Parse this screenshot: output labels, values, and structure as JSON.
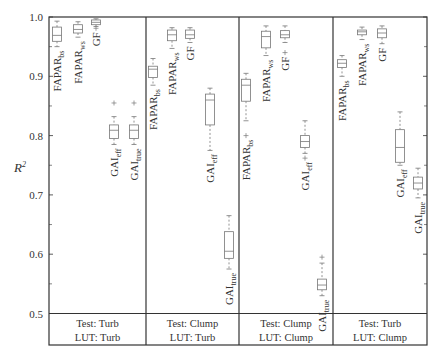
{
  "chart_data": {
    "type": "box",
    "title": "",
    "xlabel": "",
    "ylabel": "R²",
    "ylim": [
      0.5,
      1.0
    ],
    "yticks": [
      0.5,
      0.6,
      0.7,
      0.8,
      0.9,
      1.0
    ],
    "ytick_labels": [
      "0.5",
      "0.6",
      "0.7",
      "0.8",
      "0.9",
      "1.0"
    ],
    "grid": false,
    "panels": [
      {
        "test": "Test: Turb",
        "lut": "LUT: Turb",
        "boxes": [
          {
            "name": "FAPAR",
            "sub": "bs",
            "whisker_high": 0.993,
            "q3": 0.983,
            "median": 0.969,
            "q1": 0.959,
            "whisker_low": 0.95,
            "outliers": []
          },
          {
            "name": "FAPAR",
            "sub": "ws",
            "whisker_high": 0.992,
            "q3": 0.987,
            "median": 0.979,
            "q1": 0.973,
            "whisker_low": 0.966,
            "outliers": []
          },
          {
            "name": "GF",
            "sub": "",
            "whisker_high": 0.997,
            "q3": 0.995,
            "median": 0.991,
            "q1": 0.987,
            "whisker_low": 0.984,
            "outliers": [
              0.981
            ]
          },
          {
            "name": "GAI",
            "sub": "eff",
            "whisker_high": 0.832,
            "q3": 0.818,
            "median": 0.809,
            "q1": 0.795,
            "whisker_low": 0.785,
            "outliers": [
              0.855
            ]
          },
          {
            "name": "GAI",
            "sub": "true",
            "whisker_high": 0.832,
            "q3": 0.818,
            "median": 0.809,
            "q1": 0.795,
            "whisker_low": 0.785,
            "outliers": [
              0.855
            ]
          }
        ]
      },
      {
        "test": "Test: Clump",
        "lut": "LUT: Turb",
        "boxes": [
          {
            "name": "FAPAR",
            "sub": "bs",
            "whisker_high": 0.93,
            "q3": 0.917,
            "median": 0.912,
            "q1": 0.898,
            "whisker_low": 0.885,
            "outliers": []
          },
          {
            "name": "FAPAR",
            "sub": "ws",
            "whisker_high": 0.982,
            "q3": 0.978,
            "median": 0.97,
            "q1": 0.96,
            "whisker_low": 0.947,
            "outliers": []
          },
          {
            "name": "GF",
            "sub": "",
            "whisker_high": 0.982,
            "q3": 0.978,
            "median": 0.97,
            "q1": 0.964,
            "whisker_low": 0.957,
            "outliers": []
          },
          {
            "name": "GAI",
            "sub": "eff",
            "whisker_high": 0.88,
            "q3": 0.87,
            "median": 0.86,
            "q1": 0.818,
            "whisker_low": 0.775,
            "outliers": []
          },
          {
            "name": "GAI",
            "sub": "true",
            "whisker_high": 0.665,
            "q3": 0.638,
            "median": 0.605,
            "q1": 0.593,
            "whisker_low": 0.575,
            "outliers": []
          }
        ]
      },
      {
        "test": "Test: Clump",
        "lut": "LUT: Clump",
        "boxes": [
          {
            "name": "FAPAR",
            "sub": "bs",
            "whisker_high": 0.905,
            "q3": 0.895,
            "median": 0.885,
            "q1": 0.858,
            "whisker_low": 0.825,
            "outliers": [
              0.8
            ]
          },
          {
            "name": "FAPAR",
            "sub": "ws",
            "whisker_high": 0.985,
            "q3": 0.976,
            "median": 0.967,
            "q1": 0.948,
            "whisker_low": 0.935,
            "outliers": []
          },
          {
            "name": "GF",
            "sub": "",
            "whisker_high": 0.985,
            "q3": 0.977,
            "median": 0.97,
            "q1": 0.965,
            "whisker_low": 0.957,
            "outliers": [
              0.94
            ]
          },
          {
            "name": "GAI",
            "sub": "eff",
            "whisker_high": 0.825,
            "q3": 0.8,
            "median": 0.79,
            "q1": 0.78,
            "whisker_low": 0.77,
            "outliers": [
              0.762
            ]
          },
          {
            "name": "GAI",
            "sub": "true",
            "whisker_high": 0.585,
            "q3": 0.558,
            "median": 0.548,
            "q1": 0.54,
            "whisker_low": 0.53,
            "outliers": [
              0.595
            ]
          }
        ]
      },
      {
        "test": "Test: Turb",
        "lut": "LUT: Clump",
        "boxes": [
          {
            "name": "FAPAR",
            "sub": "bs",
            "whisker_high": 0.935,
            "q3": 0.928,
            "median": 0.922,
            "q1": 0.915,
            "whisker_low": 0.9,
            "outliers": []
          },
          {
            "name": "FAPAR",
            "sub": "ws",
            "whisker_high": 0.983,
            "q3": 0.978,
            "median": 0.975,
            "q1": 0.97,
            "whisker_low": 0.962,
            "outliers": []
          },
          {
            "name": "GF",
            "sub": "",
            "whisker_high": 0.985,
            "q3": 0.98,
            "median": 0.973,
            "q1": 0.965,
            "whisker_low": 0.955,
            "outliers": []
          },
          {
            "name": "GAI",
            "sub": "eff",
            "whisker_high": 0.84,
            "q3": 0.81,
            "median": 0.78,
            "q1": 0.755,
            "whisker_low": 0.75,
            "outliers": []
          },
          {
            "name": "GAI",
            "sub": "true",
            "whisker_high": 0.745,
            "q3": 0.73,
            "median": 0.72,
            "q1": 0.71,
            "whisker_low": 0.695,
            "outliers": []
          }
        ]
      }
    ]
  },
  "layout": {
    "frame": {
      "left": 49,
      "right": 427,
      "top": 17,
      "plot_bottom": 313.5,
      "table_bottom": 345
    },
    "dividers": [
      146,
      239,
      333
    ],
    "box_x": [
      [
        57,
        78,
        96,
        114,
        134
      ],
      [
        153,
        172,
        190,
        210,
        229
      ],
      [
        246,
        266,
        285,
        305,
        322
      ],
      [
        342,
        362,
        382,
        400,
        418
      ]
    ],
    "box_width": 9,
    "label_pos": [
      [
        {
          "dx": -6,
          "side": "below"
        },
        {
          "dx": -6,
          "side": "below"
        },
        {
          "dx": -6,
          "side": "below"
        },
        {
          "dx": -6,
          "side": "below"
        },
        {
          "dx": -6,
          "side": "below"
        }
      ],
      [
        {
          "dx": -6,
          "side": "below"
        },
        {
          "dx": -6,
          "side": "below"
        },
        {
          "dx": -6,
          "side": "below"
        },
        {
          "dx": -6,
          "side": "below"
        },
        {
          "dx": -6,
          "side": "below"
        }
      ],
      [
        {
          "dx": -6,
          "side": "below"
        },
        {
          "dx": -6,
          "side": "below"
        },
        {
          "dx": -6,
          "side": "below"
        },
        {
          "dx": -6,
          "side": "below"
        },
        {
          "dx": -6,
          "side": "below"
        }
      ],
      [
        {
          "dx": -6,
          "side": "below"
        },
        {
          "dx": -6,
          "side": "below"
        },
        {
          "dx": -6,
          "side": "below"
        },
        {
          "dx": -6,
          "side": "below"
        },
        {
          "dx": -6,
          "side": "below"
        }
      ]
    ],
    "colors": {
      "frame": "#333333",
      "box": "#777777",
      "text": "#333333"
    }
  }
}
